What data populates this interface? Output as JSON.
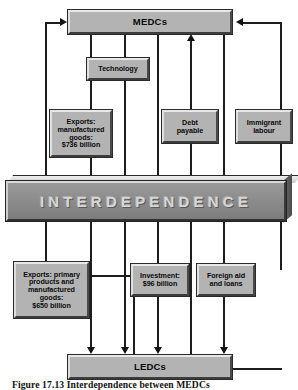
{
  "figure": {
    "caption": "Figure 17.13  Interdependence between MEDCs"
  },
  "banner": {
    "label": "INTERDEPENDENCE"
  },
  "nodes": {
    "medcs": "MEDCs",
    "ledcs": "LEDCs",
    "technology": "Technology",
    "exports_manufactured": {
      "line1": "Exports:",
      "line2": "manufactured",
      "line3": "goods:",
      "line4": "$736 billion"
    },
    "debt_payable": {
      "line1": "Debt",
      "line2": "payable"
    },
    "immigrant_labour": {
      "line1": "Immigrant",
      "line2": "labour"
    },
    "exports_primary": {
      "line1": "Exports: primary",
      "line2": "products and",
      "line3": "manufactured",
      "line4": "goods:",
      "line5": "$650 billion"
    },
    "investment": {
      "line1": "Investment:",
      "line2": "$96 billion"
    },
    "foreign_aid": {
      "line1": "Foreign aid",
      "line2": "and loans"
    }
  },
  "colors": {
    "box_fill": "#b3b3b3",
    "banner_fill": "#8e8e8e",
    "banner_text": "#d6d6d6",
    "line": "#1d1d1d",
    "page_background": "#ffffff"
  }
}
